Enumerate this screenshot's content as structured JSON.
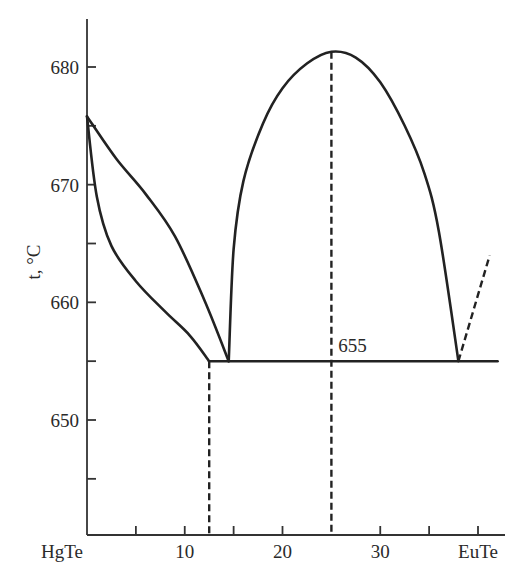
{
  "chart_data": {
    "type": "line",
    "title": "",
    "xlabel": "",
    "ylabel": "t, °C",
    "xlim": [
      0,
      42
    ],
    "ylim": [
      641,
      685
    ],
    "x_ticks": [
      {
        "value": 0,
        "label": "HgTe"
      },
      {
        "value": 5,
        "label": ""
      },
      {
        "value": 10,
        "label": "10"
      },
      {
        "value": 15,
        "label": ""
      },
      {
        "value": 20,
        "label": "20"
      },
      {
        "value": 25,
        "label": ""
      },
      {
        "value": 30,
        "label": "30"
      },
      {
        "value": 35,
        "label": ""
      },
      {
        "value": 40,
        "label": "EuTe"
      }
    ],
    "y_ticks": [
      {
        "value": 645,
        "label": ""
      },
      {
        "value": 650,
        "label": "650"
      },
      {
        "value": 655,
        "label": ""
      },
      {
        "value": 660,
        "label": "660"
      },
      {
        "value": 665,
        "label": ""
      },
      {
        "value": 670,
        "label": "670"
      },
      {
        "value": 675,
        "label": ""
      },
      {
        "value": 680,
        "label": "680"
      }
    ],
    "grid": false,
    "annotations": [
      {
        "text": "655",
        "x": 25.5,
        "y": 655.6
      }
    ],
    "series": [
      {
        "name": "liquidus (HgTe side)",
        "style": "solid",
        "x": [
          0,
          3,
          6,
          9,
          12,
          14.5
        ],
        "y": [
          675.8,
          672.2,
          669.2,
          665.6,
          660.2,
          655
        ]
      },
      {
        "name": "solidus (HgTe side)",
        "style": "solid",
        "x": [
          0,
          1,
          2.5,
          5,
          8,
          10.5,
          12.5
        ],
        "y": [
          675.8,
          669,
          664.8,
          661.8,
          659.2,
          657.2,
          655
        ]
      },
      {
        "name": "liquidus (compound dome)",
        "style": "solid",
        "x": [
          14.5,
          15,
          16,
          18,
          20,
          22.5,
          25,
          27.5,
          30,
          32.5,
          34.5,
          36,
          38
        ],
        "y": [
          655,
          664.5,
          670.3,
          675.2,
          678.2,
          680.3,
          681.3,
          680.8,
          678.7,
          675.0,
          671.0,
          666.0,
          655
        ]
      },
      {
        "name": "eutectic isotherm",
        "style": "solid",
        "x": [
          12.5,
          42
        ],
        "y": [
          655,
          655
        ]
      },
      {
        "name": "liquidus (EuTe side, extrapolated)",
        "style": "dashed",
        "x": [
          38,
          41.2
        ],
        "y": [
          655,
          664
        ]
      },
      {
        "name": "solubility limit",
        "style": "dashed",
        "x": [
          12.5,
          12.5
        ],
        "y": [
          655,
          641
        ]
      },
      {
        "name": "compound composition",
        "style": "dashed",
        "x": [
          25,
          25
        ],
        "y": [
          681.3,
          641
        ]
      }
    ]
  }
}
